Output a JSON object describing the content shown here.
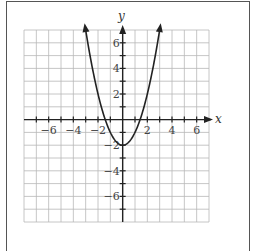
{
  "chart_data": {
    "type": "line",
    "title": "",
    "function": "y = x^2 - 2",
    "xlabel": "x",
    "ylabel": "y",
    "xlim": [
      -8,
      7
    ],
    "ylim": [
      -8,
      7
    ],
    "grid": true,
    "x_tick_labels": [
      "-6",
      "-4",
      "-2",
      "2",
      "4",
      "6"
    ],
    "y_tick_labels": [
      "6",
      "4",
      "2",
      "-2",
      "-4",
      "-6"
    ],
    "x_ticks": [
      -7,
      -6,
      -5,
      -4,
      -3,
      -2,
      -1,
      1,
      2,
      3,
      4,
      5,
      6
    ],
    "y_ticks": [
      6,
      5,
      4,
      3,
      2,
      1,
      -1,
      -2,
      -3,
      -4,
      -5,
      -6,
      -7
    ],
    "series": [
      {
        "name": "parabola",
        "vertex": [
          0,
          -2
        ],
        "x_intercepts": [
          -1.414,
          1.414
        ],
        "x": [
          -3.05,
          -3,
          -2.5,
          -2,
          -1.5,
          -1,
          -0.5,
          0,
          0.5,
          1,
          1.5,
          2,
          2.5,
          3,
          3.05
        ],
        "y": [
          7.3,
          7,
          4.25,
          2,
          0.25,
          -1,
          -1.75,
          -2,
          -1.75,
          -1,
          0.25,
          2,
          4.25,
          7,
          7.3
        ],
        "arrows_at_ends": true
      }
    ],
    "colors": {
      "curve": "#222222",
      "grid": "#b8b8b8",
      "axes": "#222222"
    }
  }
}
